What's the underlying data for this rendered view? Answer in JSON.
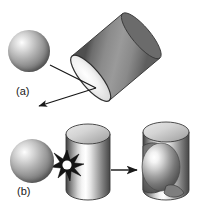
{
  "figure": {
    "background_color": "#ffffff",
    "width": 198,
    "height": 212
  },
  "panels": [
    {
      "id": "a",
      "label": "(a)",
      "description": "Sphere projectile approaching an inclined (tilted) cylindrical target; arrows indicate impact direction and ricochet/ejecta direction.",
      "objects": [
        {
          "name": "projectile-sphere",
          "shape": "sphere",
          "cx": 29,
          "cy": 51,
          "r": 21,
          "highlight": "upper-left",
          "fill_light": "#ffffff",
          "fill_dark": "#4e4e4e"
        },
        {
          "name": "tilted-cylinder-target",
          "shape": "cylinder",
          "tilt_deg": -40,
          "body_color": "#7b7b7b",
          "face_color": "#e8e8e8",
          "edge_color": "#3c3c3c"
        }
      ],
      "arrows": [
        {
          "name": "impact-direction-arrow",
          "from": [
            50,
            65
          ],
          "to": [
            95,
            87
          ],
          "head": "none"
        },
        {
          "name": "ricochet-direction-arrow",
          "from": [
            95,
            87
          ],
          "to": [
            37,
            107
          ],
          "head": "end"
        }
      ]
    },
    {
      "id": "b",
      "label": "(b)",
      "description": "Sphere impacting a vertical cylinder producing an explosion flash, and the resulting cylinder with an embedded spherical crater.",
      "objects": [
        {
          "name": "projectile-sphere",
          "shape": "sphere",
          "cx": 32,
          "cy": 161,
          "r": 22,
          "highlight": "upper-left",
          "fill_light": "#ffffff",
          "fill_dark": "#4e4e4e"
        },
        {
          "name": "impact-flash-starburst",
          "shape": "starburst",
          "cx": 67,
          "cy": 165,
          "r": 14,
          "color": "#1a1a1a",
          "core_color": "#ffffff"
        },
        {
          "name": "vertical-cylinder-target",
          "shape": "cylinder",
          "x": 66,
          "y": 124,
          "width": 44,
          "height": 76,
          "body_color": "#8a8a8a",
          "top_color": "#d0d0d0",
          "edge_color": "#3c3c3c"
        },
        {
          "name": "cratered-cylinder-result",
          "shape": "cylinder-with-crater",
          "x": 141,
          "y": 122,
          "width": 48,
          "height": 78,
          "body_color": "#8a8a8a",
          "top_color": "#d0d0d0",
          "crater_highlight": "#ffffff",
          "edge_color": "#3c3c3c"
        }
      ],
      "arrows": [
        {
          "name": "process-arrow",
          "from": [
            111,
            170
          ],
          "to": [
            139,
            170
          ],
          "head": "end"
        }
      ]
    }
  ],
  "colors": {
    "ink": "#1a1a1a",
    "background": "#ffffff",
    "metal_mid": "#8a8a8a",
    "metal_dark": "#4a4a4a",
    "metal_light": "#e6e6e6"
  }
}
